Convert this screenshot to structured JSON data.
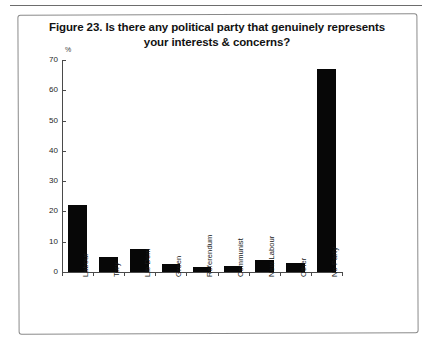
{
  "figure": {
    "title": "Figure 23. Is there any political party that genuinely represents your interests & concerns?",
    "title_line1": "Figure 23. Is there any political party that genuinely represents",
    "title_line2": "your interests & concerns?",
    "unit_label": "%"
  },
  "chart_data": {
    "type": "bar",
    "title": "Figure 23. Is there any political party that genuinely represents your interests & concerns?",
    "xlabel": "",
    "ylabel": "%",
    "ylim": [
      0,
      70
    ],
    "yticks": [
      0,
      10,
      20,
      30,
      40,
      50,
      60,
      70
    ],
    "ytick_labels": [
      "0",
      "10",
      "20",
      "30",
      "40",
      "50",
      "60",
      "70"
    ],
    "grid": false,
    "legend": false,
    "bar_color": "#070707",
    "categories": [
      "Labour",
      "Tory",
      "Lib Dem",
      "Green",
      "Referendum",
      "Communist",
      "New Labour",
      "Other",
      "No Party"
    ],
    "values": [
      22,
      5,
      7.5,
      2.5,
      1.5,
      2,
      4,
      3,
      67
    ]
  },
  "colors": {
    "bar": "#070707",
    "axis": "#4a4a4a",
    "frame": "#8a8a8a",
    "text": "#121212",
    "background": "#ffffff"
  }
}
